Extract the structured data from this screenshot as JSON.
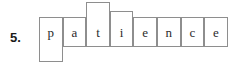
{
  "question": {
    "number_label": "5."
  },
  "puzzle": {
    "word": "patience",
    "cell_count": 8,
    "cells": [
      {
        "letter": "p",
        "extends": "down"
      },
      {
        "letter": "a",
        "extends": "none"
      },
      {
        "letter": "t",
        "extends": "up-tall"
      },
      {
        "letter": "i",
        "extends": "up-short"
      },
      {
        "letter": "e",
        "extends": "none"
      },
      {
        "letter": "n",
        "extends": "none"
      },
      {
        "letter": "c",
        "extends": "none"
      },
      {
        "letter": "e",
        "extends": "none"
      }
    ]
  },
  "style": {
    "border_color": "#8e8e8e",
    "text_color": "#2b2b2b",
    "number_color": "#1a1a1a",
    "background": "#ffffff"
  },
  "geometry": {
    "row_left": 39,
    "row_top": 17,
    "row_bottom": 47,
    "cell_width": 23.6,
    "tall_top": 2,
    "short_top": 11,
    "drop_bottom": 62
  }
}
